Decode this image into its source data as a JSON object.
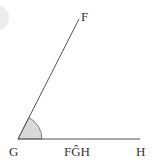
{
  "diagram": {
    "type": "angle",
    "vertex": {
      "label": "G",
      "x": 18,
      "y": 139
    },
    "ray_points": [
      {
        "label": "F",
        "x": 79,
        "y": 19
      },
      {
        "label": "H",
        "x": 140,
        "y": 139
      }
    ],
    "angle_label": "FĜH",
    "labels": {
      "F": "F",
      "G": "G",
      "H": "H",
      "angle": "FĜH"
    },
    "colors": {
      "line": "#555555",
      "arc_fill": "#d9d9d9",
      "text": "#333333",
      "corner_circle": "#e8e8e8"
    }
  }
}
